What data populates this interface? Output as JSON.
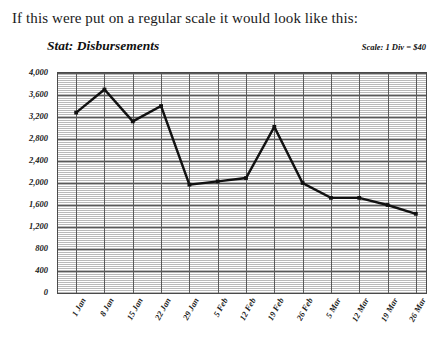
{
  "intro": {
    "text": "If this were put on a regular scale it would look like this:"
  },
  "chart_panel": {
    "title": "Stat: Disbursements",
    "scale_note": "Scale: 1 Div = $40"
  },
  "chart_data": {
    "type": "line",
    "title": "Stat: Disbursements",
    "xlabel": "",
    "ylabel": "",
    "categories": [
      "1 Jan",
      "8 Jan",
      "15 Jan",
      "22 Jan",
      "29 Jan",
      "5 Feb",
      "12 Feb",
      "19 Feb",
      "26 Feb",
      "5 Mar",
      "12 Mar",
      "19 Mar",
      "26 Mar"
    ],
    "values": [
      3280,
      3700,
      3120,
      3400,
      1970,
      2030,
      2090,
      3020,
      2000,
      1730,
      1730,
      1600,
      1440
    ],
    "ylim": [
      0,
      4000
    ],
    "ytick_step": 400,
    "yticks": [
      "4,000",
      "3,600",
      "3,200",
      "2,800",
      "2,400",
      "2,000",
      "1,600",
      "1,200",
      "800",
      "400",
      "0"
    ],
    "ytick_values": [
      4000,
      3600,
      3200,
      2800,
      2400,
      2000,
      1600,
      1200,
      800,
      400,
      0
    ],
    "grid": true,
    "legend": "none",
    "line_color": "#111111",
    "grid_color": "#5a5a5a",
    "minor_grid_color": "#b9b9b9"
  }
}
